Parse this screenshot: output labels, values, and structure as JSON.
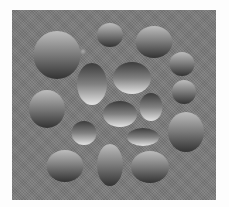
{
  "image": {
    "description": "Shape-from-shading illusion: gray field with shaded ellipses appearing convex (light top) or concave (dark top)",
    "width": 229,
    "height": 207
  },
  "panel": {
    "x": 12,
    "y": 10,
    "width": 204,
    "height": 190,
    "color": "#7b7b7b"
  },
  "colors": {
    "convex_top": "#bdbdbd",
    "convex_mid": "#7a7a7a",
    "convex_bottom": "#333333",
    "concave_top": "#3c3c3c",
    "concave_mid": "#808080",
    "concave_bottom": "#e4e4e4"
  },
  "shapes": [
    {
      "id": "convex-top-left-large",
      "type": "convex",
      "cx": 57,
      "cy": 55,
      "rx": 23.5,
      "ry": 24
    },
    {
      "id": "convex-top-center-small",
      "type": "convex",
      "cx": 110,
      "cy": 35,
      "rx": 13,
      "ry": 12
    },
    {
      "id": "convex-top-right",
      "type": "convex",
      "cx": 154,
      "cy": 42,
      "rx": 18.5,
      "ry": 16
    },
    {
      "id": "convex-right-small-1",
      "type": "convex",
      "cx": 182,
      "cy": 64,
      "rx": 12.5,
      "ry": 12
    },
    {
      "id": "convex-right-small-2",
      "type": "convex",
      "cx": 184,
      "cy": 92,
      "rx": 12,
      "ry": 12
    },
    {
      "id": "convex-right-large",
      "type": "convex",
      "cx": 186,
      "cy": 132,
      "rx": 18,
      "ry": 20
    },
    {
      "id": "convex-left-middle",
      "type": "convex",
      "cx": 47,
      "cy": 109,
      "rx": 18,
      "ry": 19
    },
    {
      "id": "concave-vertical-ellipse",
      "type": "concave",
      "cx": 92,
      "cy": 84,
      "rx": 15,
      "ry": 21
    },
    {
      "id": "concave-top-center",
      "type": "concave",
      "cx": 132,
      "cy": 78,
      "rx": 19,
      "ry": 16
    },
    {
      "id": "concave-center",
      "type": "concave",
      "cx": 120,
      "cy": 114,
      "rx": 17,
      "ry": 13
    },
    {
      "id": "concave-right",
      "type": "concave",
      "cx": 151,
      "cy": 107,
      "rx": 11.5,
      "ry": 14
    },
    {
      "id": "concave-small-left",
      "type": "concave",
      "cx": 84,
      "cy": 133,
      "rx": 12.5,
      "ry": 12
    },
    {
      "id": "concave-lower-right-ellipse",
      "type": "concave",
      "cx": 143,
      "cy": 137,
      "rx": 16,
      "ry": 9
    },
    {
      "id": "convex-bottom-left",
      "type": "convex",
      "cx": 65,
      "cy": 166,
      "rx": 18.5,
      "ry": 16
    },
    {
      "id": "convex-bottom-center-vertical",
      "type": "convex",
      "cx": 110,
      "cy": 165,
      "rx": 13,
      "ry": 21
    },
    {
      "id": "convex-bottom-right",
      "type": "convex",
      "cx": 150,
      "cy": 167,
      "rx": 19,
      "ry": 16
    },
    {
      "id": "tiny-bump",
      "type": "convex-faint",
      "cx": 83,
      "cy": 52,
      "rx": 3,
      "ry": 3
    }
  ]
}
